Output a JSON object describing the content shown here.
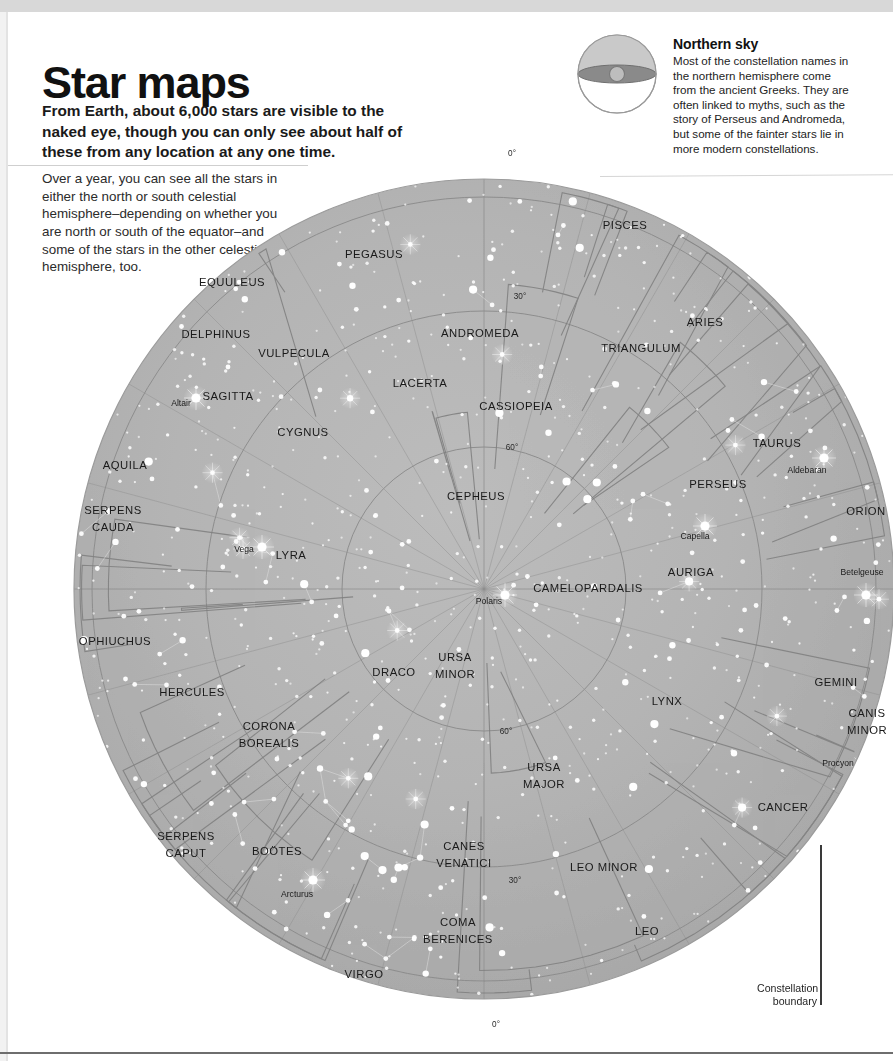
{
  "header": {
    "title": "Star maps",
    "subtitle": "From Earth, about 6,000 stars are visible to the naked eye, though you can only see about half of these from any location at any one time.",
    "intro": "Over a year, you can see all the stars in either the north or south celestial hemisphere–depending on whether you are north or south of the equator–and some of the stars in the other celestial hemisphere, too."
  },
  "callout": {
    "heading": "Northern sky",
    "body": "Most of the constellation names in the northern hemisphere come from the ancient Greeks. They are often linked to myths, such as the story of Perseus and Andromeda, but some of the fainter stars lie in more modern constellations.",
    "icon": "celestial-sphere-icon"
  },
  "legend": {
    "line1": "Constellation",
    "line2": "boundary"
  },
  "chart_data": {
    "type": "scatter",
    "projection": "polar-azimuthal",
    "center_label": "Polaris",
    "declination_rings": [
      {
        "value": "0°",
        "radius_px": 392
      },
      {
        "value": "30°",
        "radius_px": 278
      },
      {
        "value": "60°",
        "radius_px": 142
      }
    ],
    "dec_tick_labels": [
      {
        "text": "0°",
        "x": 512,
        "y": 16
      },
      {
        "text": "30°",
        "x": 520,
        "y": 159
      },
      {
        "text": "60°",
        "x": 512,
        "y": 310
      },
      {
        "text": "60°",
        "x": 506,
        "y": 594
      },
      {
        "text": "30°",
        "x": 515,
        "y": 743
      },
      {
        "text": "0°",
        "x": 496,
        "y": 887
      }
    ],
    "grid": true,
    "legend_position": "bottom-right",
    "constellations": [
      {
        "name": "PISCES",
        "x": 625,
        "y": 89
      },
      {
        "name": "PEGASUS",
        "x": 374,
        "y": 118
      },
      {
        "name": "EQUULEUS",
        "x": 232,
        "y": 146
      },
      {
        "name": "ARIES",
        "x": 705,
        "y": 186
      },
      {
        "name": "ANDROMEDA",
        "x": 480,
        "y": 197
      },
      {
        "name": "DELPHINUS",
        "x": 216,
        "y": 198
      },
      {
        "name": "TRIANGULUM",
        "x": 641,
        "y": 212
      },
      {
        "name": "VULPECULA",
        "x": 294,
        "y": 217
      },
      {
        "name": "LACERTA",
        "x": 420,
        "y": 247
      },
      {
        "name": "CASSIOPEIA",
        "x": 516,
        "y": 270
      },
      {
        "name": "SAGITTA",
        "x": 228,
        "y": 260
      },
      {
        "name": "CYGNUS",
        "x": 303,
        "y": 296
      },
      {
        "name": "TAURUS",
        "x": 777,
        "y": 307
      },
      {
        "name": "AQUILA",
        "x": 125,
        "y": 329
      },
      {
        "name": "PERSEUS",
        "x": 718,
        "y": 348
      },
      {
        "name": "ORION",
        "x": 866,
        "y": 375
      },
      {
        "name": "SERPENS",
        "x": 113,
        "y": 374
      },
      {
        "name": "CAUDA",
        "x": 113,
        "y": 391
      },
      {
        "name": "CEPHEUS",
        "x": 476,
        "y": 360
      },
      {
        "name": "LYRA",
        "x": 291,
        "y": 419
      },
      {
        "name": "AURIGA",
        "x": 691,
        "y": 436
      },
      {
        "name": "CAMELOPARDALIS",
        "x": 588,
        "y": 452
      },
      {
        "name": "OPHIUCHUS",
        "x": 115,
        "y": 505
      },
      {
        "name": "URSA",
        "x": 455,
        "y": 521
      },
      {
        "name": "MINOR",
        "x": 455,
        "y": 538
      },
      {
        "name": "DRACO",
        "x": 394,
        "y": 536
      },
      {
        "name": "LYNX",
        "x": 667,
        "y": 565
      },
      {
        "name": "GEMINI",
        "x": 836,
        "y": 546
      },
      {
        "name": "HERCULES",
        "x": 192,
        "y": 556
      },
      {
        "name": "CANIS",
        "x": 867,
        "y": 577
      },
      {
        "name": "MINOR",
        "x": 867,
        "y": 594
      },
      {
        "name": "CORONA",
        "x": 269,
        "y": 590
      },
      {
        "name": "BOREALIS",
        "x": 269,
        "y": 607
      },
      {
        "name": "URSA",
        "x": 544,
        "y": 631
      },
      {
        "name": "MAJOR",
        "x": 544,
        "y": 648
      },
      {
        "name": "CANCER",
        "x": 783,
        "y": 671
      },
      {
        "name": "SERPENS",
        "x": 186,
        "y": 700
      },
      {
        "name": "CAPUT",
        "x": 186,
        "y": 717
      },
      {
        "name": "BOÖTES",
        "x": 277,
        "y": 715
      },
      {
        "name": "CANES",
        "x": 464,
        "y": 710
      },
      {
        "name": "VENATICI",
        "x": 464,
        "y": 727
      },
      {
        "name": "LEO MINOR",
        "x": 604,
        "y": 731
      },
      {
        "name": "COMA",
        "x": 458,
        "y": 786
      },
      {
        "name": "BERENICES",
        "x": 458,
        "y": 803
      },
      {
        "name": "LEO",
        "x": 647,
        "y": 795
      },
      {
        "name": "VIRGO",
        "x": 364,
        "y": 838
      }
    ],
    "named_stars": [
      {
        "name": "Altair",
        "label_x": 181,
        "label_y": 266,
        "star_x": 196,
        "star_y": 258,
        "bright": true
      },
      {
        "name": "Vega",
        "label_x": 244,
        "label_y": 412,
        "star_x": 262,
        "star_y": 407,
        "bright": true
      },
      {
        "name": "Polaris",
        "label_x": 489,
        "label_y": 464,
        "star_x": 505,
        "star_y": 455,
        "bright": true
      },
      {
        "name": "Aldebaran",
        "label_x": 807,
        "label_y": 333,
        "star_x": 824,
        "star_y": 318,
        "bright": true
      },
      {
        "name": "Capella",
        "label_x": 695,
        "label_y": 399,
        "star_x": 705,
        "star_y": 386,
        "bright": true
      },
      {
        "name": "Betelgeuse",
        "label_x": 862,
        "label_y": 435,
        "star_x": 866,
        "star_y": 455,
        "bright": true
      },
      {
        "name": "Procyon",
        "label_x": 838,
        "label_y": 626,
        "star_x": 863,
        "star_y": 626,
        "bright": true
      },
      {
        "name": "Arcturus",
        "label_x": 297,
        "label_y": 757,
        "star_x": 313,
        "star_y": 740,
        "bright": true
      }
    ]
  },
  "colors": {
    "disc_fill": "#b3b3b3",
    "grid_line": "#8f8f8f",
    "boundary_line": "#7d7d7d",
    "constellation_line": "#dcdcdc",
    "star": "#ffffff",
    "text": "#1a1a1a",
    "page_band": "#d8d8d8"
  }
}
